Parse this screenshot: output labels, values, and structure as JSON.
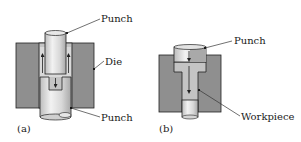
{
  "figure": {
    "panel_a": {
      "caption": "(a)",
      "labels": {
        "top_punch": "Punch",
        "die": "Die",
        "bottom_punch": "Punch"
      }
    },
    "panel_b": {
      "caption": "(b)",
      "labels": {
        "punch": "Punch",
        "workpiece": "Workpiece"
      }
    },
    "colors": {
      "die": "#8f8f8f",
      "workpiece": "#c4c4c4",
      "punch_light": "#e6e6e6",
      "punch_shade": "#b5b5b5",
      "outline": "#222222",
      "background": "#ffffff"
    }
  }
}
